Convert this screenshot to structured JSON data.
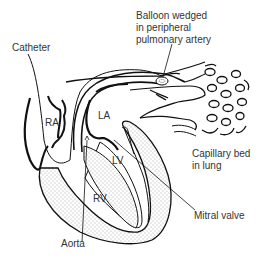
{
  "diagram": {
    "type": "anatomical-illustration",
    "labels": {
      "catheter": "Catheter",
      "balloon_line1": "Balloon wedged",
      "balloon_line2": "in peripheral",
      "balloon_line3": "pulmonary artery",
      "ra": "RA",
      "la": "LA",
      "lv": "LV",
      "rv": "RV",
      "capillary_line1": "Capillary bed",
      "capillary_line2": "in lung",
      "mitral_valve": "Mitral valve",
      "aorta": "Aorta"
    },
    "colors": {
      "ink": "#111111",
      "text": "#333333",
      "background": "#ffffff",
      "stipple": "#555555"
    }
  }
}
